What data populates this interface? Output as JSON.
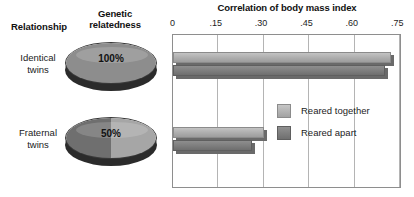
{
  "headers": {
    "relationship": "Relationship",
    "genetic_relatedness": "Genetic\nrelatedness",
    "genetic_relatedness_line1": "Genetic",
    "genetic_relatedness_line2": "relatedness",
    "chart_title": "Correlation of body mass index"
  },
  "rows": [
    {
      "relationship_line1": "Identical",
      "relationship_line2": "twins",
      "genetic_relatedness": "100%"
    },
    {
      "relationship_line1": "Fraternal",
      "relationship_line2": "twins",
      "genetic_relatedness": "50%"
    }
  ],
  "legend": {
    "items": [
      {
        "label": "Reared together",
        "color": "#b0b0b0"
      },
      {
        "label": "Reared apart",
        "color": "#7d7d7d"
      }
    ]
  },
  "axis": {
    "ticks": [
      "0",
      ".15",
      ".30",
      ".45",
      ".60",
      ".75"
    ],
    "min": 0,
    "max": 0.75
  },
  "chart_data": {
    "type": "bar",
    "orientation": "horizontal",
    "title": "Correlation of body mass index",
    "xlabel": "Correlation of body mass index",
    "ylabel": "Relationship",
    "categories": [
      "Identical twins",
      "Fraternal twins"
    ],
    "series": [
      {
        "name": "Reared together",
        "values": [
          0.72,
          0.3
        ],
        "color": "#b0b0b0"
      },
      {
        "name": "Reared apart",
        "values": [
          0.7,
          0.26
        ],
        "color": "#7d7d7d"
      }
    ],
    "xlim": [
      0,
      0.75
    ],
    "xticks": [
      0,
      0.15,
      0.3,
      0.45,
      0.6,
      0.75
    ],
    "xticklabels": [
      "0",
      ".15",
      ".30",
      ".45",
      ".60",
      ".75"
    ],
    "grid": true,
    "grid_axis": "x",
    "legend_position": "inside-right-middle",
    "annotations": [
      {
        "text": "100%",
        "target": "Identical twins",
        "meaning": "genetic relatedness"
      },
      {
        "text": "50%",
        "target": "Fraternal twins",
        "meaning": "genetic relatedness"
      }
    ]
  }
}
